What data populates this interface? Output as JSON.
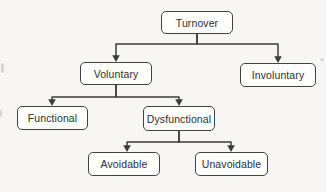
{
  "diagram": {
    "type": "tree",
    "nodes": {
      "turnover": {
        "label": "Turnover"
      },
      "voluntary": {
        "label": "Voluntary"
      },
      "involuntary": {
        "label": "Involuntary"
      },
      "functional": {
        "label": "Functional"
      },
      "dysfunctional": {
        "label": "Dysfunctional"
      },
      "avoidable": {
        "label": "Avoidable"
      },
      "unavoidable": {
        "label": "Unavoidable"
      }
    },
    "edges": [
      {
        "from": "turnover",
        "to": "voluntary"
      },
      {
        "from": "turnover",
        "to": "involuntary"
      },
      {
        "from": "voluntary",
        "to": "functional"
      },
      {
        "from": "voluntary",
        "to": "dysfunctional"
      },
      {
        "from": "dysfunctional",
        "to": "avoidable"
      },
      {
        "from": "dysfunctional",
        "to": "unavoidable"
      }
    ],
    "colors": {
      "background": "#f7f6f3",
      "box_fill": "#fdfdfc",
      "border": "#414141",
      "text": "#2f2f2f",
      "connector": "#3c3c3c"
    }
  }
}
